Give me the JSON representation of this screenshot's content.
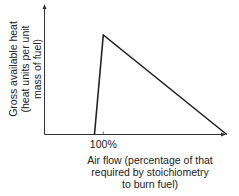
{
  "chart_data": {
    "type": "line",
    "title": "",
    "xlabel_lines": [
      "Air flow (percentage of that",
      "required by stoichiometry",
      "to burn fuel)"
    ],
    "ylabel_lines": [
      "Gross available heat",
      "(heat units per unit",
      "mass of fuel)"
    ],
    "x_ticks": [
      {
        "value": 100,
        "label": "100%"
      }
    ],
    "xlim": [
      0,
      360
    ],
    "ylim": [
      0,
      1.3
    ],
    "grid": false,
    "legend": "none",
    "series": [
      {
        "name": "Gross available heat",
        "x": [
          85,
          100,
          310
        ],
        "y": [
          0,
          1.0,
          0
        ]
      }
    ],
    "color": "#222222"
  }
}
